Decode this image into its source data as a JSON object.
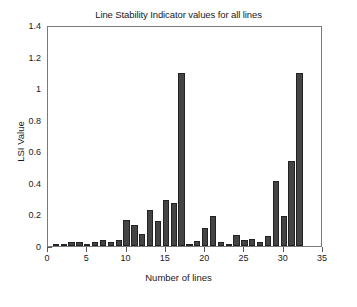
{
  "chart_data": {
    "type": "bar",
    "title": "Line Stability Indicator values for all lines",
    "xlabel": "Number of lines",
    "ylabel": "LSI Value",
    "xlim": [
      0,
      35
    ],
    "ylim": [
      0,
      1.4
    ],
    "xticks": [
      0,
      5,
      10,
      15,
      20,
      25,
      30,
      35
    ],
    "xtick_labels": [
      "0",
      "5",
      "10",
      "15",
      "20",
      "25",
      "30",
      "35"
    ],
    "yticks": [
      0,
      0.2,
      0.4,
      0.6,
      0.8,
      1,
      1.2,
      1.4
    ],
    "ytick_labels": [
      "0",
      "0.2",
      "0.4",
      "0.6",
      "0.8",
      "1",
      "1.2",
      "1.4"
    ],
    "grid": false,
    "legend": null,
    "bar_color": "#444444",
    "bar_edge_color": "#222222",
    "bar_width": 0.8,
    "categories": [
      1,
      2,
      3,
      4,
      5,
      6,
      7,
      8,
      9,
      10,
      11,
      12,
      13,
      14,
      15,
      16,
      17,
      18,
      19,
      20,
      21,
      22,
      23,
      24,
      25,
      26,
      27,
      28,
      29,
      30,
      31,
      32
    ],
    "values": [
      0.005,
      0.012,
      0.028,
      0.028,
      0.012,
      0.028,
      0.036,
      0.024,
      0.041,
      0.167,
      0.136,
      0.079,
      0.225,
      0.157,
      0.292,
      0.27,
      1.094,
      0.008,
      0.034,
      0.112,
      0.192,
      0.023,
      0.01,
      0.069,
      0.04,
      0.047,
      0.023,
      0.063,
      0.412,
      0.192,
      0.541,
      1.094
    ]
  },
  "axes": {
    "title": "Line Stability Indicator values for all lines",
    "x_label": "Number of lines",
    "y_label": "LSI Value"
  }
}
